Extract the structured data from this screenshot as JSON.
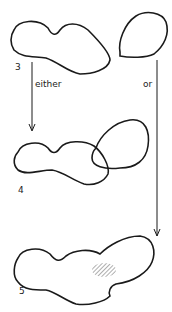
{
  "diagram": {
    "stages": [
      {
        "id": "3",
        "label": "3"
      },
      {
        "id": "4",
        "label": "4"
      },
      {
        "id": "5",
        "label": "5"
      }
    ],
    "branches": [
      {
        "label": "either",
        "from": "3",
        "to": "4"
      },
      {
        "label": "or",
        "from": "3",
        "to": "5"
      }
    ],
    "colors": {
      "stroke": "#1a1a1a",
      "hatch": "#777777",
      "background": "#ffffff"
    }
  }
}
